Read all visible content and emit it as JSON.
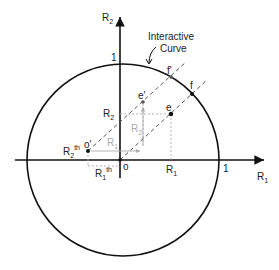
{
  "diagram": {
    "axes": {
      "x_label": "R",
      "x_label_sub": "1",
      "y_label": "R",
      "y_label_sub": "2",
      "x_tick_one": "1",
      "y_tick_one": "1",
      "origin": "o"
    },
    "curve_annotation": {
      "line1": "Interactive",
      "line2": "Curve"
    },
    "points": {
      "e": "e",
      "e_prime": "e'",
      "f": "f",
      "f_prime": "f'",
      "o_prime": "o'"
    },
    "labels": {
      "R2": "R",
      "R2_sub": "2",
      "R1": "R",
      "R1_sub": "1",
      "R2_th": "R",
      "R2_th_sub": "2",
      "R2_th_sup": "th",
      "R1_th": "R",
      "R1_th_sub": "1",
      "R1_th_sup": "th",
      "gray_R2": "R",
      "gray_R2_sub": "2",
      "gray_R1": "R",
      "gray_R1_sub": "1"
    },
    "colors": {
      "axis": "#111111",
      "curve": "#111111",
      "dashed": "#555555",
      "gray_construct": "#aaaaaa"
    }
  }
}
